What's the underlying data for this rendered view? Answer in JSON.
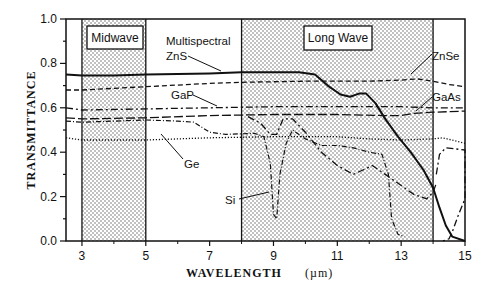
{
  "chart_data": {
    "type": "line",
    "title": "",
    "xlabel": "WAVELENGTH",
    "xunit": "(µm)",
    "ylabel": "TRANSMITTANCE",
    "xlim": [
      2.5,
      15
    ],
    "ylim": [
      0.0,
      1.0
    ],
    "x_ticks": [
      3,
      5,
      7,
      9,
      11,
      13,
      15
    ],
    "x_minor_ticks": [
      4,
      6,
      8,
      10,
      12,
      14
    ],
    "y_ticks": [
      "0.0",
      "0.2",
      "0.4",
      "0.6",
      "0.8",
      "1.0"
    ],
    "y_minor_step": 0.1,
    "grid": false,
    "legend": "inline annotations",
    "bands": [
      {
        "name": "Midwave",
        "x_start": 3,
        "x_end": 5,
        "fill": "stippled"
      },
      {
        "name": "Long Wave",
        "x_start": 8,
        "x_end": 14,
        "fill": "stippled"
      }
    ],
    "series": [
      {
        "name": "Multispectral ZnS",
        "style": "solid-thick",
        "points": [
          [
            2.5,
            0.75
          ],
          [
            3,
            0.745
          ],
          [
            4,
            0.745
          ],
          [
            5,
            0.75
          ],
          [
            7,
            0.755
          ],
          [
            8,
            0.76
          ],
          [
            9,
            0.76
          ],
          [
            9.8,
            0.76
          ],
          [
            10.3,
            0.75
          ],
          [
            10.7,
            0.7
          ],
          [
            11.1,
            0.66
          ],
          [
            11.4,
            0.65
          ],
          [
            11.7,
            0.665
          ],
          [
            11.9,
            0.665
          ],
          [
            12.2,
            0.62
          ],
          [
            12.5,
            0.55
          ],
          [
            12.9,
            0.47
          ],
          [
            13.3,
            0.4
          ],
          [
            13.7,
            0.32
          ],
          [
            14,
            0.24
          ],
          [
            14.2,
            0.15
          ],
          [
            14.4,
            0.07
          ],
          [
            14.6,
            0.02
          ],
          [
            15,
            0.0
          ]
        ]
      },
      {
        "name": "ZnSe",
        "style": "dashed",
        "points": [
          [
            2.5,
            0.68
          ],
          [
            3,
            0.68
          ],
          [
            5,
            0.695
          ],
          [
            7,
            0.71
          ],
          [
            8,
            0.715
          ],
          [
            10,
            0.72
          ],
          [
            12,
            0.72
          ],
          [
            13,
            0.725
          ],
          [
            13.5,
            0.73
          ],
          [
            14,
            0.72
          ],
          [
            14.5,
            0.705
          ],
          [
            15,
            0.695
          ]
        ]
      },
      {
        "name": "GaP",
        "style": "dash-dot",
        "points": [
          [
            2.5,
            0.6
          ],
          [
            3,
            0.59
          ],
          [
            5,
            0.595
          ],
          [
            7,
            0.6
          ],
          [
            9,
            0.605
          ],
          [
            11,
            0.605
          ],
          [
            13,
            0.605
          ],
          [
            14,
            0.6
          ],
          [
            15,
            0.6
          ]
        ]
      },
      {
        "name": "GaAs",
        "style": "long-dash",
        "points": [
          [
            2.5,
            0.555
          ],
          [
            3,
            0.55
          ],
          [
            5,
            0.555
          ],
          [
            7,
            0.565
          ],
          [
            9,
            0.57
          ],
          [
            11,
            0.57
          ],
          [
            12.6,
            0.565
          ],
          [
            13,
            0.565
          ],
          [
            13.4,
            0.575
          ],
          [
            14,
            0.58
          ],
          [
            15,
            0.585
          ]
        ]
      },
      {
        "name": "Ge",
        "style": "dotted",
        "points": [
          [
            2.5,
            0.465
          ],
          [
            3,
            0.455
          ],
          [
            5,
            0.455
          ],
          [
            7,
            0.465
          ],
          [
            9,
            0.47
          ],
          [
            10,
            0.47
          ],
          [
            11,
            0.47
          ],
          [
            12,
            0.46
          ],
          [
            13,
            0.455
          ],
          [
            14,
            0.46
          ],
          [
            14.3,
            0.465
          ],
          [
            15,
            0.44
          ]
        ]
      },
      {
        "name": "Si",
        "style": "dashed-dotted-thin",
        "points": [
          [
            2.5,
            0.54
          ],
          [
            3,
            0.535
          ],
          [
            5,
            0.545
          ],
          [
            6,
            0.54
          ],
          [
            6.5,
            0.535
          ],
          [
            7,
            0.49
          ],
          [
            7.5,
            0.48
          ],
          [
            8.4,
            0.485
          ],
          [
            8.7,
            0.47
          ],
          [
            8.9,
            0.35
          ],
          [
            9.0,
            0.12
          ],
          [
            9.1,
            0.1
          ],
          [
            9.2,
            0.3
          ],
          [
            9.4,
            0.44
          ],
          [
            9.6,
            0.5
          ],
          [
            10,
            0.46
          ],
          [
            10.5,
            0.43
          ],
          [
            11,
            0.43
          ],
          [
            11.5,
            0.42
          ],
          [
            12,
            0.4
          ],
          [
            12.4,
            0.39
          ],
          [
            12.6,
            0.3
          ],
          [
            12.7,
            0.1
          ],
          [
            12.9,
            0.03
          ],
          [
            13.1,
            0.02
          ]
        ]
      },
      {
        "name": "Si (second trace)",
        "style": "dash-dot",
        "points": [
          [
            8.2,
            0.56
          ],
          [
            8.6,
            0.53
          ],
          [
            8.9,
            0.48
          ],
          [
            9.1,
            0.48
          ],
          [
            9.3,
            0.55
          ],
          [
            9.6,
            0.55
          ],
          [
            10,
            0.49
          ],
          [
            10.5,
            0.4
          ],
          [
            11,
            0.34
          ],
          [
            11.5,
            0.3
          ],
          [
            11.8,
            0.32
          ],
          [
            12.1,
            0.34
          ],
          [
            12.5,
            0.3
          ],
          [
            13,
            0.25
          ],
          [
            13.4,
            0.21
          ],
          [
            13.8,
            0.19
          ],
          [
            14.0,
            0.22
          ],
          [
            14.1,
            0.26
          ]
        ]
      },
      {
        "name": "ZnSe/Si tail (14-15)",
        "style": "dash-dot",
        "points": [
          [
            14.1,
            0.3
          ],
          [
            14.2,
            0.39
          ],
          [
            14.4,
            0.42
          ],
          [
            15,
            0.41
          ],
          [
            15,
            0.19
          ],
          [
            14.8,
            0.12
          ],
          [
            14.6,
            0.04
          ],
          [
            14.5,
            0.01
          ],
          [
            14.3,
            0.0
          ]
        ]
      }
    ],
    "annotations": [
      {
        "text": "Multispectral",
        "x": 6.4,
        "y": 0.8
      },
      {
        "text": "ZnS",
        "x": 6.4,
        "y": 0.745
      },
      {
        "text": "GaP",
        "x": 5.6,
        "y": 0.645
      },
      {
        "text": "ZnSe",
        "x": 14.0,
        "y": 0.76
      },
      {
        "text": "GaAs",
        "x": 14.0,
        "y": 0.61
      },
      {
        "text": "Ge",
        "x": 5.9,
        "y": 0.43
      },
      {
        "text": "Si",
        "x": 7.6,
        "y": 0.2
      }
    ]
  },
  "labels": {
    "midwave": "Midwave",
    "longwave": "Long Wave",
    "multispectral": "Multispectral",
    "zns": "ZnS",
    "gap": "GaP",
    "znse": "ZnSe",
    "gaas": "GaAs",
    "ge": "Ge",
    "si": "Si",
    "xlabel": "WAVELENGTH",
    "xunit": "(µm)",
    "ylabel": "TRANSMITTANCE",
    "xticks": [
      "3",
      "5",
      "7",
      "9",
      "11",
      "13",
      "15"
    ],
    "yticks": [
      "0.0",
      "0.2",
      "0.4",
      "0.6",
      "0.8",
      "1.0"
    ]
  }
}
